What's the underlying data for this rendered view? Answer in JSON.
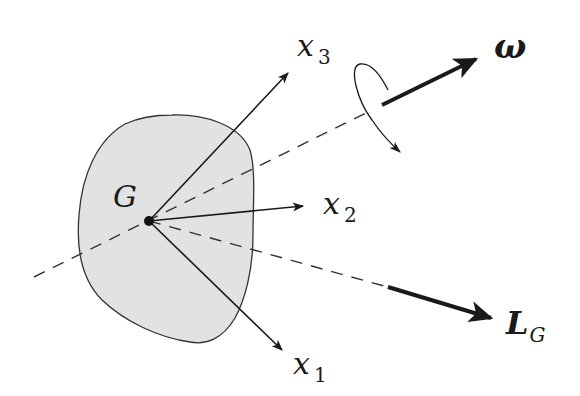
{
  "diagram": {
    "type": "rigid-body-angular-momentum",
    "body": {
      "label": "G",
      "fill": "#e2e2e2",
      "stroke": "#333333"
    },
    "axes": [
      {
        "id": "x1",
        "base": "x",
        "sub": "1"
      },
      {
        "id": "x2",
        "base": "x",
        "sub": "2"
      },
      {
        "id": "x3",
        "base": "x",
        "sub": "3"
      }
    ],
    "angular_velocity": {
      "label": "ω"
    },
    "angular_momentum": {
      "base": "L",
      "sub": "G"
    },
    "colors": {
      "ink": "#1a1a1a",
      "body_fill": "#e2e2e2",
      "dash": "#333333"
    }
  }
}
